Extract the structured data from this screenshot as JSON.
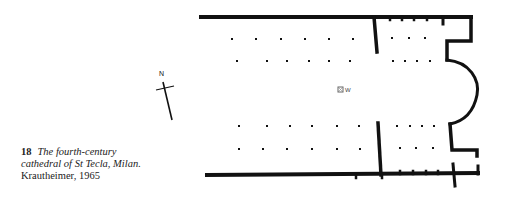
{
  "figure": {
    "number": "18",
    "title": "The fourth-century cathedral of St Tecla, Milan.",
    "title_line1": "The fourth-century",
    "title_line2": "cathedral of St Tecla, Milan.",
    "credit": "Krautheimer, 1965"
  },
  "north_arrow": {
    "label": "N",
    "icon": "north-arrow-icon"
  },
  "plan": {
    "marker_label": "W",
    "marker_icon": "well-marker-icon",
    "colors": {
      "ink": "#111111",
      "background": "#ffffff"
    },
    "columns": {
      "nave_top_row1": [
        [
          232,
          39
        ],
        [
          256,
          39
        ],
        [
          281,
          39
        ],
        [
          305,
          39
        ],
        [
          329,
          39
        ],
        [
          353,
          39
        ]
      ],
      "nave_top_row2": [
        [
          237,
          61
        ],
        [
          267,
          61
        ],
        [
          287,
          61
        ],
        [
          309,
          61
        ],
        [
          329,
          61
        ],
        [
          350,
          61
        ]
      ],
      "nave_bottom_row1": [
        [
          239,
          126
        ],
        [
          267,
          126
        ],
        [
          290,
          126
        ],
        [
          312,
          126
        ],
        [
          337,
          126
        ],
        [
          359,
          126
        ]
      ],
      "nave_bottom_row2": [
        [
          239,
          149
        ],
        [
          263,
          149
        ],
        [
          287,
          149
        ],
        [
          312,
          149
        ],
        [
          337,
          149
        ],
        [
          360,
          149
        ]
      ],
      "east_top_row1": [
        [
          392,
          38
        ],
        [
          409,
          38
        ],
        [
          425,
          38
        ]
      ],
      "east_top_row2": [
        [
          393,
          61
        ],
        [
          405,
          61
        ],
        [
          417,
          61
        ],
        [
          430,
          61
        ]
      ],
      "east_bottom_row1": [
        [
          397,
          126
        ],
        [
          410,
          126
        ],
        [
          422,
          126
        ],
        [
          434,
          126
        ]
      ],
      "east_bottom_row2": [
        [
          400,
          148
        ],
        [
          416,
          148
        ],
        [
          433,
          148
        ]
      ]
    }
  }
}
